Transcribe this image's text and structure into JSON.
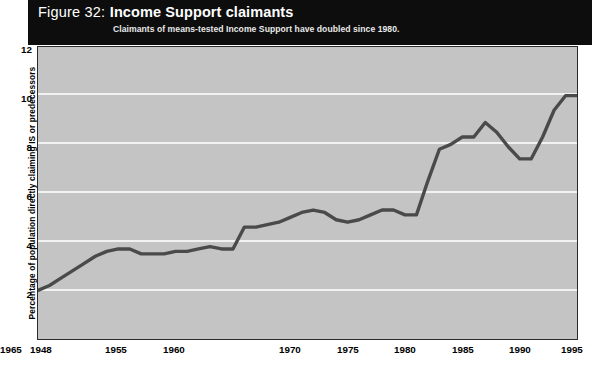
{
  "header": {
    "figure_number": "Figure 32:",
    "title": "Income Support claimants",
    "subtitle": "Claimants of means-tested Income Support have doubled since 1980.",
    "band_color": "#0d0d0d",
    "text_color": "#ffffff"
  },
  "axes": {
    "y_axis_title": "Percentage of population directly claiming IS or predecessors",
    "y_ticks": [
      "12",
      "10",
      "8",
      "6",
      "4",
      "2"
    ],
    "x_ticks": [
      "1948",
      "1955",
      "1960",
      "1965",
      "1970",
      "1975",
      "1980",
      "1985",
      "1990",
      "1995"
    ]
  },
  "source": {
    "text": ""
  },
  "style": {
    "plot_background": "#c4c4c4",
    "grid_color": "#f2f2f2",
    "line_color": "#4a4a4a",
    "frame_color": "#2b2b2b"
  },
  "chart_data": {
    "type": "line",
    "title": "Figure 32: Income Support claimants",
    "subtitle": "Claimants of means-tested Income Support have doubled since 1980.",
    "xlabel": "",
    "ylabel": "Percentage of population directly claiming IS or predecessors",
    "xlim": [
      1948,
      1995
    ],
    "ylim": [
      0,
      12
    ],
    "y_ticks": [
      2,
      4,
      6,
      8,
      10,
      12
    ],
    "x_ticks": [
      1948,
      1955,
      1960,
      1965,
      1970,
      1975,
      1980,
      1985,
      1990,
      1995
    ],
    "grid": "horizontal",
    "legend": "none",
    "series": [
      {
        "name": "Percentage of population directly claiming IS or predecessors",
        "color": "#4a4a4a",
        "x": [
          1948,
          1949,
          1950,
          1951,
          1952,
          1953,
          1954,
          1955,
          1956,
          1957,
          1958,
          1959,
          1960,
          1961,
          1962,
          1963,
          1964,
          1965,
          1966,
          1967,
          1968,
          1969,
          1970,
          1971,
          1972,
          1973,
          1974,
          1975,
          1976,
          1977,
          1978,
          1979,
          1980,
          1981,
          1982,
          1983,
          1984,
          1985,
          1986,
          1987,
          1988,
          1989,
          1990,
          1991,
          1992,
          1993,
          1994,
          1995
        ],
        "values": [
          2.0,
          2.2,
          2.5,
          2.8,
          3.1,
          3.4,
          3.6,
          3.7,
          3.7,
          3.5,
          3.5,
          3.5,
          3.6,
          3.6,
          3.7,
          3.8,
          3.7,
          3.7,
          4.6,
          4.6,
          4.7,
          4.8,
          5.0,
          5.2,
          5.3,
          5.2,
          4.9,
          4.8,
          4.9,
          5.1,
          5.3,
          5.3,
          5.1,
          5.1,
          6.5,
          7.8,
          8.0,
          8.3,
          8.3,
          8.9,
          8.5,
          7.9,
          7.4,
          7.4,
          8.3,
          9.4,
          10.0,
          10.0
        ]
      }
    ]
  }
}
